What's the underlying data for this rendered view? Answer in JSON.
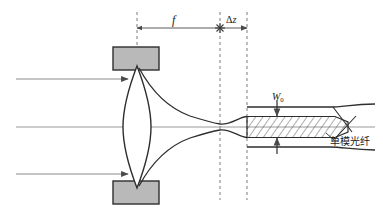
{
  "figure": {
    "type": "optical-ray-diagram",
    "title_visible": false,
    "background_color": "#ffffff",
    "line_color": "#3a3a3a",
    "axis_color": "#8a8a8a",
    "mount_fill": "#b9b9b9",
    "mount_stroke": "#3a3a3a",
    "hatch_color": "#4a4a4a",
    "dash_color": "#6e6e6e"
  },
  "labels": {
    "focal_length": "f",
    "defocus_symbol": "Δ",
    "defocus_var": "z",
    "beam_waist_symbol": "W",
    "beam_waist_subscript": "0",
    "fiber_name": "单模光纤"
  },
  "components": {
    "lens": {
      "name": "biconvex-lens",
      "center_x": 137,
      "center_y": 127,
      "half_width": 14,
      "half_height": 61
    },
    "mount_top": {
      "name": "lens-mount-top",
      "x": 113,
      "y": 47,
      "width": 46,
      "height": 23
    },
    "mount_bottom": {
      "name": "lens-mount-bottom",
      "x": 113,
      "y": 181,
      "width": 46,
      "height": 23
    },
    "fiber": {
      "name": "single-mode-fiber",
      "start_x": 247,
      "core_top_y": 117,
      "core_bottom_y": 137,
      "clad_top_y": 107,
      "clad_bottom_y": 147,
      "break_x": 335,
      "end_x": 375
    },
    "optical_axis_y": 127
  },
  "rays": {
    "incoming": [
      {
        "name": "ray-upper",
        "y": 79,
        "x_start": 16,
        "x_end": 128
      },
      {
        "name": "ray-lower",
        "y": 174,
        "x_start": 16,
        "x_end": 128
      }
    ],
    "axis_line": {
      "name": "optical-axis",
      "y": 127,
      "x_start": 16,
      "x_end": 375
    }
  },
  "dimension_lines": {
    "focal": {
      "name": "focal-length-dimension",
      "y": 28,
      "x_start": 137,
      "x_end": 220
    },
    "defocus": {
      "name": "defocus-dimension",
      "y": 28,
      "x_start": 220,
      "x_end": 247
    },
    "waist": {
      "name": "beam-waist-dimension",
      "x": 277,
      "y_top": 107,
      "y_bottom": 147
    }
  },
  "guides": {
    "dashed_lines": [
      {
        "name": "lens-plane-dashed",
        "x": 137,
        "y_start": 12,
        "y_end": 50
      },
      {
        "name": "focal-plane-dashed",
        "x": 220,
        "y_start": 12,
        "y_end": 200
      },
      {
        "name": "fiber-endface-dashed",
        "x": 247,
        "y_start": 12,
        "y_end": 200
      }
    ],
    "focus_marker": {
      "name": "focus-star-marker",
      "x": 220,
      "y": 28
    }
  }
}
